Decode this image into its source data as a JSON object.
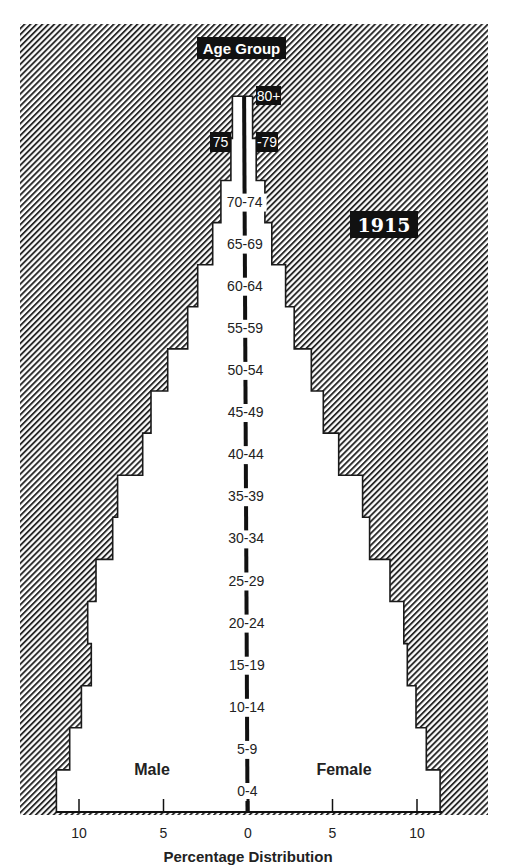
{
  "chart_data": {
    "type": "bar",
    "subtype": "population-pyramid",
    "title": "1915",
    "category_axis_title": "Age Group",
    "xlabel": "Percentage Distribution",
    "ylabel": "Age Group",
    "categories": [
      "0-4",
      "5-9",
      "10-14",
      "15-19",
      "20-24",
      "25-29",
      "30-34",
      "35-39",
      "40-44",
      "45-49",
      "50-54",
      "55-59",
      "60-64",
      "65-69",
      "70-74",
      "75-79",
      "80+"
    ],
    "series": [
      {
        "name": "Male",
        "values": [
          11.3,
          10.5,
          9.8,
          9.2,
          9.4,
          8.9,
          7.9,
          7.6,
          6.1,
          5.6,
          4.6,
          3.4,
          2.8,
          1.9,
          1.4,
          0.8,
          0.7
        ]
      },
      {
        "name": "Female",
        "values": [
          11.4,
          10.6,
          10.0,
          9.5,
          9.3,
          8.5,
          7.3,
          6.9,
          5.5,
          4.6,
          3.9,
          2.9,
          2.4,
          1.6,
          1.2,
          0.7,
          0.5
        ]
      }
    ],
    "xticks": [
      10,
      5,
      0,
      5,
      10
    ],
    "xlim": [
      -12,
      12
    ],
    "grid": false,
    "legend": {
      "left": "Male",
      "right": "Female",
      "position": "inside-bottom"
    },
    "background": "diagonal hatch"
  },
  "labels": {
    "age_group_header": "Age Group",
    "year": "1915",
    "male": "Male",
    "female": "Female",
    "axis_title": "Percentage Distribution",
    "label_75": "75",
    "label_79": "-79",
    "label_80": "80+"
  },
  "colors": {
    "ink": "#1a1a1a",
    "paper": "#ffffff",
    "hatch": "#333333"
  }
}
